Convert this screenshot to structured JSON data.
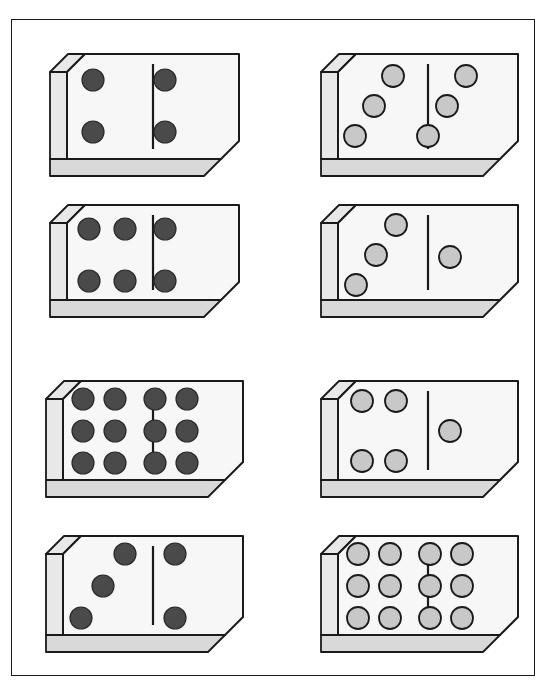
{
  "figure": {
    "frame": {
      "x": 11,
      "y": 19,
      "width": 524,
      "height": 657,
      "border_color": "#1a1a1a",
      "background": "#ffffff"
    },
    "layout": {
      "columns": 2,
      "rows": 4,
      "total_dominoes": 8
    },
    "colors": {
      "outline": "#1a1a1a",
      "face": "#f7f7f7",
      "side_face": "#e8e8e8",
      "bottom_face": "#d9d9d9",
      "pip_dark": "#4a4a4a",
      "pip_light": "#c8c8c8",
      "background": "#ffffff"
    }
  },
  "dominoes": [
    {
      "id": "domino-1",
      "position": {
        "row": 1,
        "column": 1,
        "x": 47,
        "y": 51,
        "width": 172,
        "height": 122
      },
      "pip_style": "dark",
      "left_value": 2,
      "right_value": 2,
      "total": 4,
      "left_pips": [
        {
          "cx": 26,
          "cy": 26
        },
        {
          "cx": 26,
          "cy": 78
        }
      ],
      "right_pips": [
        {
          "cx": 98,
          "cy": 26
        },
        {
          "cx": 98,
          "cy": 78
        }
      ]
    },
    {
      "id": "domino-2",
      "position": {
        "row": 1,
        "column": 2,
        "x": 318,
        "y": 51,
        "width": 180,
        "height": 122
      },
      "pip_style": "light",
      "left_value": 3,
      "right_value": 3,
      "total": 6,
      "left_pips": [
        {
          "cx": 55,
          "cy": 22
        },
        {
          "cx": 36,
          "cy": 52
        },
        {
          "cx": 17,
          "cy": 82
        }
      ],
      "right_pips": [
        {
          "cx": 128,
          "cy": 22
        },
        {
          "cx": 109,
          "cy": 52
        },
        {
          "cx": 90,
          "cy": 82
        }
      ]
    },
    {
      "id": "domino-3",
      "position": {
        "row": 2,
        "column": 1,
        "x": 47,
        "y": 202,
        "width": 172,
        "height": 112
      },
      "pip_style": "dark",
      "left_value": 4,
      "right_value": 2,
      "total": 6,
      "left_pips": [
        {
          "cx": 22,
          "cy": 24
        },
        {
          "cx": 58,
          "cy": 24
        },
        {
          "cx": 22,
          "cy": 76
        },
        {
          "cx": 58,
          "cy": 76
        }
      ],
      "right_pips": [
        {
          "cx": 98,
          "cy": 24
        },
        {
          "cx": 98,
          "cy": 76
        }
      ]
    },
    {
      "id": "domino-4",
      "position": {
        "row": 2,
        "column": 2,
        "x": 318,
        "y": 202,
        "width": 180,
        "height": 112
      },
      "pip_style": "light",
      "left_value": 3,
      "right_value": 1,
      "total": 4,
      "left_pips": [
        {
          "cx": 58,
          "cy": 20
        },
        {
          "cx": 38,
          "cy": 50
        },
        {
          "cx": 18,
          "cy": 80
        }
      ],
      "right_pips": [
        {
          "cx": 112,
          "cy": 52
        }
      ]
    },
    {
      "id": "domino-5",
      "position": {
        "row": 3,
        "column": 1,
        "x": 43,
        "y": 378,
        "width": 180,
        "height": 116
      },
      "pip_style": "dark",
      "left_value": 6,
      "right_value": 6,
      "total": 12,
      "left_pips": [
        {
          "cx": 20,
          "cy": 18
        },
        {
          "cx": 52,
          "cy": 18
        },
        {
          "cx": 20,
          "cy": 50
        },
        {
          "cx": 52,
          "cy": 50
        },
        {
          "cx": 20,
          "cy": 82
        },
        {
          "cx": 52,
          "cy": 82
        }
      ],
      "right_pips": [
        {
          "cx": 92,
          "cy": 18
        },
        {
          "cx": 124,
          "cy": 18
        },
        {
          "cx": 92,
          "cy": 50
        },
        {
          "cx": 124,
          "cy": 50
        },
        {
          "cx": 92,
          "cy": 82
        },
        {
          "cx": 124,
          "cy": 82
        }
      ]
    },
    {
      "id": "domino-6",
      "position": {
        "row": 3,
        "column": 2,
        "x": 318,
        "y": 378,
        "width": 180,
        "height": 116
      },
      "pip_style": "light",
      "left_value": 4,
      "right_value": 1,
      "total": 5,
      "left_pips": [
        {
          "cx": 24,
          "cy": 20
        },
        {
          "cx": 58,
          "cy": 20
        },
        {
          "cx": 24,
          "cy": 80
        },
        {
          "cx": 58,
          "cy": 80
        }
      ],
      "right_pips": [
        {
          "cx": 112,
          "cy": 50
        }
      ]
    },
    {
      "id": "domino-7",
      "position": {
        "row": 4,
        "column": 1,
        "x": 43,
        "y": 533,
        "width": 180,
        "height": 116
      },
      "pip_style": "dark",
      "left_value": 3,
      "right_value": 2,
      "total": 5,
      "left_pips": [
        {
          "cx": 62,
          "cy": 18
        },
        {
          "cx": 40,
          "cy": 50
        },
        {
          "cx": 18,
          "cy": 82
        }
      ],
      "right_pips": [
        {
          "cx": 112,
          "cy": 18
        },
        {
          "cx": 112,
          "cy": 82
        }
      ]
    },
    {
      "id": "domino-8",
      "position": {
        "row": 4,
        "column": 2,
        "x": 318,
        "y": 533,
        "width": 180,
        "height": 116
      },
      "pip_style": "light",
      "left_value": 6,
      "right_value": 6,
      "total": 12,
      "left_pips": [
        {
          "cx": 20,
          "cy": 18
        },
        {
          "cx": 52,
          "cy": 18
        },
        {
          "cx": 20,
          "cy": 50
        },
        {
          "cx": 52,
          "cy": 50
        },
        {
          "cx": 20,
          "cy": 82
        },
        {
          "cx": 52,
          "cy": 82
        }
      ],
      "right_pips": [
        {
          "cx": 92,
          "cy": 18
        },
        {
          "cx": 124,
          "cy": 18
        },
        {
          "cx": 92,
          "cy": 50
        },
        {
          "cx": 124,
          "cy": 50
        },
        {
          "cx": 92,
          "cy": 82
        },
        {
          "cx": 124,
          "cy": 82
        }
      ]
    }
  ]
}
